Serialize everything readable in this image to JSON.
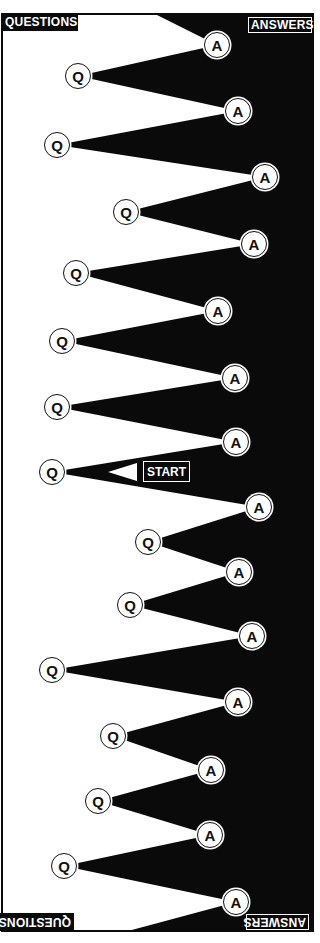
{
  "colors": {
    "background": "#ffffff",
    "fill": "#0a0a0a",
    "node_fill": "#ffffff",
    "node_stroke": "#111111"
  },
  "frame": {
    "left": 2,
    "top": 14,
    "right": 313,
    "bottom": 931
  },
  "labels": {
    "top_left": "QUESTIONS",
    "top_right": "ANSWERS",
    "bottom_left": "QUESTIONS",
    "bottom_right": "ANSWERS",
    "start": "START"
  },
  "shape": {
    "top_point": [
      155,
      14
    ],
    "bottom_point": [
      128,
      931
    ]
  },
  "start_marker": {
    "arrow": {
      "tip": [
        108,
        472
      ],
      "base_top": [
        137,
        463
      ],
      "base_bottom": [
        137,
        481
      ]
    },
    "box": {
      "x": 143,
      "y": 461,
      "w": 47,
      "h": 21
    }
  },
  "nodes": [
    {
      "type": "A",
      "label": "A",
      "x": 217,
      "y": 45
    },
    {
      "type": "Q",
      "label": "Q",
      "x": 78,
      "y": 76
    },
    {
      "type": "A",
      "label": "A",
      "x": 238,
      "y": 111
    },
    {
      "type": "Q",
      "label": "Q",
      "x": 57,
      "y": 145
    },
    {
      "type": "A",
      "label": "A",
      "x": 265,
      "y": 177
    },
    {
      "type": "Q",
      "label": "Q",
      "x": 126,
      "y": 212
    },
    {
      "type": "A",
      "label": "A",
      "x": 254,
      "y": 244
    },
    {
      "type": "Q",
      "label": "Q",
      "x": 76,
      "y": 273
    },
    {
      "type": "A",
      "label": "A",
      "x": 218,
      "y": 311
    },
    {
      "type": "Q",
      "label": "Q",
      "x": 62,
      "y": 341
    },
    {
      "type": "A",
      "label": "A",
      "x": 235,
      "y": 378
    },
    {
      "type": "Q",
      "label": "Q",
      "x": 57,
      "y": 407
    },
    {
      "type": "A",
      "label": "A",
      "x": 236,
      "y": 442
    },
    {
      "type": "Q",
      "label": "Q",
      "x": 52,
      "y": 472
    },
    {
      "type": "A",
      "label": "A",
      "x": 259,
      "y": 507
    },
    {
      "type": "Q",
      "label": "Q",
      "x": 148,
      "y": 542
    },
    {
      "type": "A",
      "label": "A",
      "x": 239,
      "y": 572
    },
    {
      "type": "Q",
      "label": "Q",
      "x": 130,
      "y": 605
    },
    {
      "type": "A",
      "label": "A",
      "x": 252,
      "y": 636
    },
    {
      "type": "Q",
      "label": "Q",
      "x": 52,
      "y": 670
    },
    {
      "type": "A",
      "label": "A",
      "x": 238,
      "y": 702
    },
    {
      "type": "Q",
      "label": "Q",
      "x": 113,
      "y": 736
    },
    {
      "type": "A",
      "label": "A",
      "x": 211,
      "y": 770
    },
    {
      "type": "Q",
      "label": "Q",
      "x": 98,
      "y": 801
    },
    {
      "type": "A",
      "label": "A",
      "x": 210,
      "y": 835
    },
    {
      "type": "Q",
      "label": "Q",
      "x": 64,
      "y": 866
    },
    {
      "type": "A",
      "label": "A",
      "x": 236,
      "y": 902
    }
  ]
}
